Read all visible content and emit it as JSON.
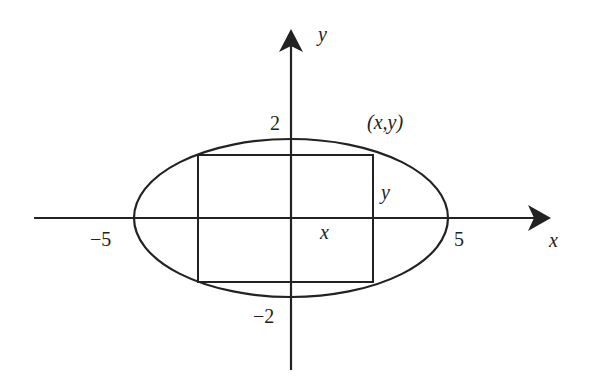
{
  "diagram": {
    "type": "ellipse-inscribed-rectangle",
    "ellipse": {
      "semi_major_x": 5,
      "semi_minor_y": 2
    },
    "labels": {
      "y_axis": "y",
      "x_axis": "x",
      "tick_y_pos": "2",
      "tick_y_neg": "−2",
      "tick_x_neg": "−5",
      "tick_x_pos": "5",
      "point": "(x,y)",
      "rect_half_height": "y",
      "rect_half_width": "x"
    },
    "colors": {
      "stroke": "#222222",
      "background": "#ffffff"
    }
  }
}
